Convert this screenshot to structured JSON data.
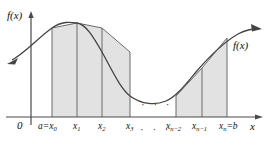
{
  "figure": {
    "type": "trapezoidal-rule-diagram",
    "axis_labels": {
      "y_axis": "f(x)",
      "x_axis": "x",
      "origin": "0"
    },
    "curve_label": "f(x)",
    "ellipsis_axis": "· · ·",
    "ellipsis_region": "· · ·",
    "colors": {
      "fill": "#e2e2e2",
      "stroke": "#6b6b6b",
      "curve": "#444444",
      "axis": "#4a4a4a",
      "text": "#111111"
    },
    "tick_labels": [
      {
        "id": "x0",
        "text": "a=x",
        "sub": "0",
        "x": 52
      },
      {
        "id": "x1",
        "text": "x",
        "sub": "1",
        "x": 77
      },
      {
        "id": "x2",
        "text": "x",
        "sub": "2",
        "x": 102
      },
      {
        "id": "x3",
        "text": "x",
        "sub": "3",
        "x": 130
      },
      {
        "id": "xn2",
        "text": "x",
        "sub": "n−2",
        "x": 176
      },
      {
        "id": "xn1",
        "text": "x",
        "sub": "n−1",
        "x": 202
      },
      {
        "id": "xn",
        "text": "x",
        "sub": "n",
        "suffix": "=b",
        "x": 227
      }
    ],
    "partition_points": [
      {
        "id": "x0",
        "x": 52,
        "y": 28
      },
      {
        "id": "x1",
        "x": 77,
        "y": 23
      },
      {
        "id": "x2",
        "x": 102,
        "y": 28
      },
      {
        "id": "x3",
        "x": 130,
        "y": 52
      },
      {
        "id": "xn2",
        "x": 176,
        "y": 96
      },
      {
        "id": "xn1",
        "x": 202,
        "y": 68
      },
      {
        "id": "xn",
        "x": 227,
        "y": 38
      }
    ],
    "baseline_y": 117,
    "trapezoids": [
      {
        "id": "trap-1",
        "from": "x0",
        "to": "x1"
      },
      {
        "id": "trap-2",
        "from": "x1",
        "to": "x2"
      },
      {
        "id": "trap-3",
        "from": "x2",
        "to": "x3"
      },
      {
        "id": "trap-4",
        "from": "xn2",
        "to": "xn1"
      },
      {
        "id": "trap-5",
        "from": "xn1",
        "to": "xn"
      }
    ]
  }
}
